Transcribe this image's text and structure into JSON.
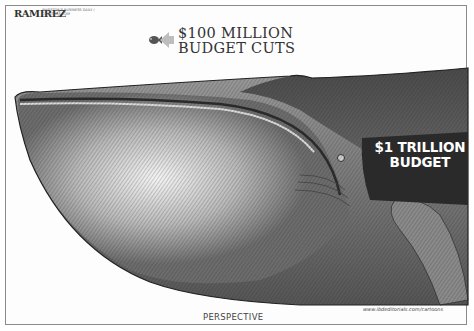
{
  "cartoon": {
    "title": "PERSPECTIVE",
    "signature": "RAMIREZ",
    "signature_credit": "INVESTOR'S BUSINESS DAILY / CREATORS.COM",
    "url": "www.ibdeditorials.com/cartoons",
    "small_item_label": {
      "line1": "$100 MILLION",
      "line2": "BUDGET CUTS"
    },
    "large_item_label": {
      "line1": "$1 TRILLION",
      "line2": "BUDGET"
    },
    "icons": {
      "small": "fish-icon",
      "pointer": "arrow-left-icon",
      "large": "whale-illustration"
    },
    "colors": {
      "border": "#8a8a8a",
      "ink": "#333333",
      "whale_dark": "#3a3a3a",
      "whale_mid": "#7a7a7a",
      "whale_light": "#e8e8e8",
      "label_text": "#ffffff"
    }
  }
}
